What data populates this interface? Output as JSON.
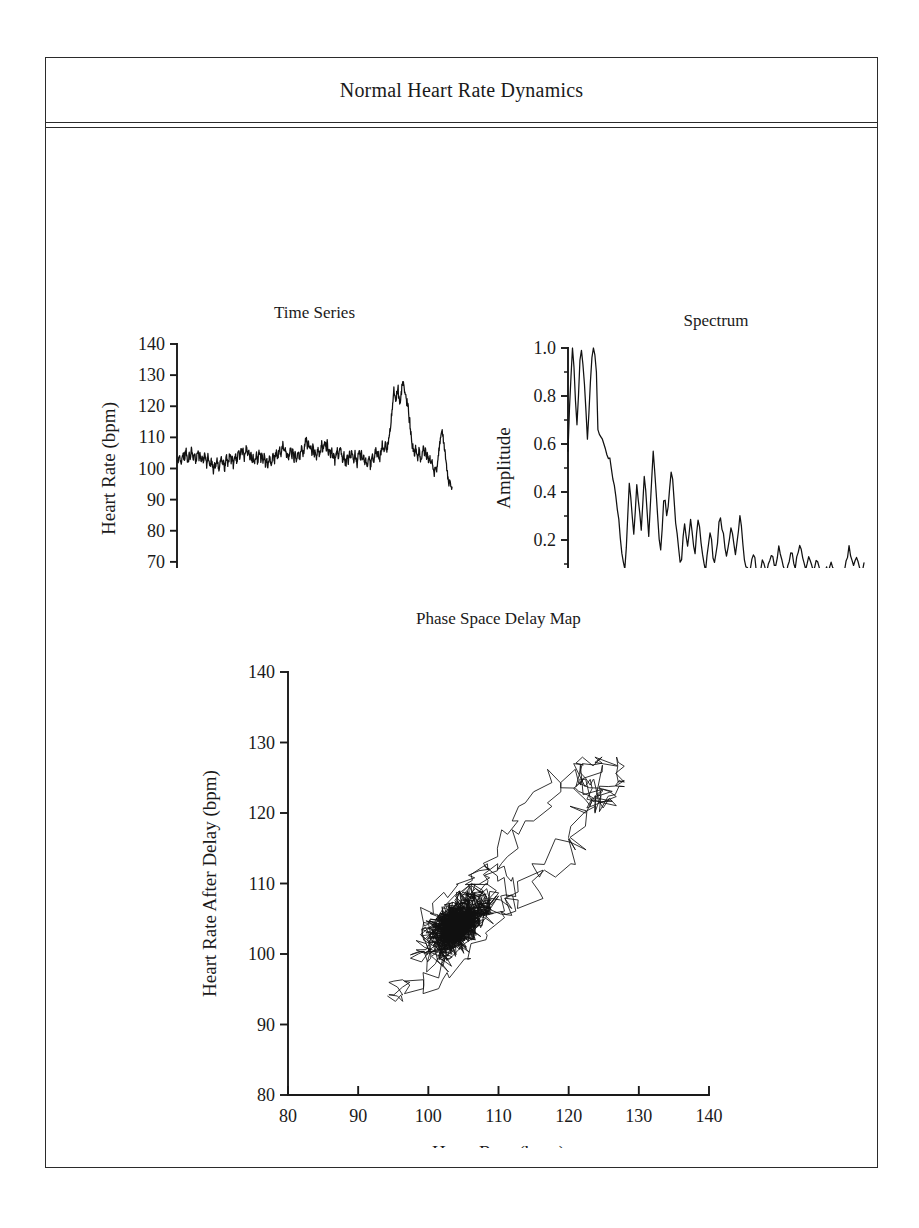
{
  "figure": {
    "title": "Normal Heart Rate Dynamics",
    "background_color": "#ffffff",
    "line_color": "#111111",
    "frame_color": "#2b2b2b"
  },
  "chart_data": [
    {
      "id": "time_series",
      "type": "line",
      "title": "Time Series",
      "xlabel": "Time (sec)",
      "ylabel": "Heart Rate (bpm)",
      "xlim": [
        0,
        900
      ],
      "ylim": [
        60,
        140
      ],
      "xticks": [
        0,
        300,
        600,
        900
      ],
      "xtick_labels": [
        "0",
        "300",
        "600",
        "900"
      ],
      "yticks": [
        60,
        70,
        80,
        90,
        100,
        110,
        120,
        130,
        140
      ],
      "ytick_labels": [
        "60",
        "70",
        "80",
        "90",
        "100",
        "110",
        "120",
        "130",
        "140"
      ],
      "grid": false,
      "legend": null,
      "series": [
        {
          "name": "heart rate",
          "description": "Noisy baseline near 103 bpm for first 700 s, then a large tachycardic burst peaking near 128 bpm around 700-760 s, followed by recovery and a secondary peak near 112 bpm at 880 s, ending near 93 bpm.",
          "x_start": 0,
          "x_end": 900,
          "sample_interval_sec": 1.5,
          "baseline_bpm": 103,
          "noise_amplitude_bpm": 4.5,
          "peak_bpm": 128,
          "min_bpm": 93,
          "events": [
            {
              "t": 710,
              "bpm": 125,
              "label": "burst peak 1"
            },
            {
              "t": 742,
              "bpm": 128,
              "label": "burst peak 2"
            },
            {
              "t": 880,
              "bpm": 112,
              "label": "secondary peak"
            },
            {
              "t": 898,
              "bpm": 93,
              "label": "end dip"
            }
          ],
          "values_bpm": [
            103,
            102,
            104,
            103,
            102,
            105,
            104,
            103,
            106,
            104,
            102,
            105,
            103,
            106,
            104,
            103,
            105,
            102,
            104,
            106,
            103,
            105,
            101,
            104,
            102,
            105,
            103,
            101,
            104,
            102,
            100,
            103,
            101,
            99,
            102,
            100,
            103,
            101,
            99,
            102,
            104,
            101,
            103,
            100,
            102,
            104,
            101,
            103,
            105,
            102,
            104,
            101,
            103,
            105,
            102,
            104,
            106,
            103,
            107,
            104,
            106,
            103,
            105,
            107,
            104,
            106,
            103,
            105,
            102,
            104,
            101,
            103,
            105,
            102,
            104,
            106,
            103,
            105,
            102,
            104,
            101,
            103,
            100,
            102,
            104,
            101,
            103,
            105,
            102,
            104,
            106,
            103,
            105,
            107,
            104,
            106,
            108,
            105,
            107,
            104,
            106,
            103,
            105,
            107,
            104,
            106,
            103,
            105,
            102,
            104,
            106,
            103,
            105,
            107,
            104,
            106,
            108,
            110,
            107,
            109,
            106,
            108,
            105,
            107,
            104,
            106,
            103,
            105,
            107,
            104,
            106,
            108,
            105,
            107,
            109,
            106,
            108,
            105,
            107,
            104,
            106,
            103,
            105,
            102,
            104,
            106,
            103,
            105,
            107,
            104,
            102,
            105,
            103,
            101,
            104,
            102,
            105,
            103,
            106,
            104,
            102,
            105,
            103,
            101,
            104,
            106,
            103,
            105,
            102,
            104,
            101,
            103,
            100,
            102,
            104,
            101,
            103,
            105,
            102,
            104,
            106,
            103,
            105,
            102,
            104,
            106,
            108,
            105,
            107,
            109,
            106,
            108,
            110,
            112,
            115,
            120,
            124,
            125,
            122,
            124,
            126,
            123,
            121,
            124,
            127,
            128,
            126,
            124,
            122,
            120,
            117,
            114,
            111,
            108,
            106,
            104,
            107,
            105,
            103,
            106,
            104,
            102,
            105,
            107,
            104,
            106,
            103,
            105,
            102,
            104,
            101,
            103,
            100,
            98,
            101,
            99,
            102,
            105,
            108,
            111,
            112,
            110,
            107,
            104,
            101,
            98,
            95,
            97,
            94,
            93
          ]
        }
      ]
    },
    {
      "id": "spectrum",
      "type": "line",
      "title": "Spectrum",
      "xlabel": "Frequency (Hz)",
      "ylabel": "Amplitude",
      "xlim": [
        0.0,
        0.1
      ],
      "ylim": [
        0.0,
        1.0
      ],
      "xticks": [
        0.0,
        0.02,
        0.04,
        0.06,
        0.08,
        0.1
      ],
      "xtick_labels": [
        "0.00",
        "0.02",
        "0.04",
        "0.06",
        "0.08",
        "0.10"
      ],
      "xminor_step": 0.01,
      "yticks": [
        0.0,
        0.2,
        0.4,
        0.6,
        0.8,
        1.0
      ],
      "ytick_labels": [
        "0.0",
        "0.2",
        "0.4",
        "0.6",
        "0.8",
        "1.0"
      ],
      "yminor_step": 0.1,
      "grid": false,
      "legend": null,
      "series": [
        {
          "name": "amplitude spectrum",
          "description": "Very low frequency power dominates with amplitude 1.0 near DC, decaying to a broadband 1/f-like tail of roughly 0.05-0.3 above 0.03 Hz.",
          "freq_start": 0.0,
          "freq_end": 0.1,
          "freq_step": 0.000667,
          "peak_amplitude": 1.0,
          "values": [
            0.57,
            0.75,
            0.88,
            1.0,
            0.92,
            0.78,
            0.68,
            0.8,
            0.95,
            0.99,
            0.93,
            0.85,
            0.74,
            0.62,
            0.73,
            0.86,
            0.96,
            1.0,
            0.97,
            0.9,
            0.66,
            0.64,
            0.63,
            0.62,
            0.6,
            0.58,
            0.56,
            0.55,
            0.53,
            0.5,
            0.46,
            0.42,
            0.38,
            0.33,
            0.28,
            0.22,
            0.16,
            0.11,
            0.07,
            0.18,
            0.32,
            0.42,
            0.37,
            0.28,
            0.22,
            0.33,
            0.42,
            0.38,
            0.3,
            0.24,
            0.36,
            0.45,
            0.4,
            0.3,
            0.23,
            0.34,
            0.47,
            0.58,
            0.5,
            0.38,
            0.28,
            0.2,
            0.16,
            0.26,
            0.38,
            0.36,
            0.3,
            0.35,
            0.42,
            0.49,
            0.44,
            0.36,
            0.28,
            0.21,
            0.15,
            0.1,
            0.13,
            0.2,
            0.27,
            0.22,
            0.17,
            0.24,
            0.29,
            0.25,
            0.19,
            0.15,
            0.22,
            0.28,
            0.24,
            0.18,
            0.13,
            0.09,
            0.07,
            0.12,
            0.18,
            0.23,
            0.19,
            0.14,
            0.1,
            0.14,
            0.2,
            0.26,
            0.3,
            0.26,
            0.21,
            0.16,
            0.12,
            0.16,
            0.21,
            0.25,
            0.22,
            0.18,
            0.14,
            0.19,
            0.25,
            0.29,
            0.24,
            0.18,
            0.13,
            0.1,
            0.08,
            0.07,
            0.09,
            0.12,
            0.14,
            0.11,
            0.08,
            0.06,
            0.07,
            0.09,
            0.12,
            0.1,
            0.08,
            0.07,
            0.09,
            0.12,
            0.14,
            0.13,
            0.11,
            0.09,
            0.13,
            0.16,
            0.14,
            0.11,
            0.08,
            0.06,
            0.05,
            0.08,
            0.12,
            0.15,
            0.13,
            0.1,
            0.08,
            0.12,
            0.16,
            0.18,
            0.15,
            0.12,
            0.09,
            0.07,
            0.1,
            0.13,
            0.11,
            0.09,
            0.07,
            0.1,
            0.13,
            0.12,
            0.09,
            0.07,
            0.05,
            0.04,
            0.06,
            0.08,
            0.07,
            0.09,
            0.11,
            0.08,
            0.06,
            0.05,
            0.07,
            0.06,
            0.04,
            0.03,
            0.05,
            0.08,
            0.11,
            0.14,
            0.16,
            0.13,
            0.1,
            0.08,
            0.11,
            0.13,
            0.1,
            0.07,
            0.05,
            0.08,
            0.1
          ]
        }
      ]
    },
    {
      "id": "phase_space_delay_map",
      "type": "scatter",
      "title": "Phase Space Delay Map",
      "xlabel": "Heart Rate (bpm)",
      "ylabel": "Heart Rate After Delay (bpm)",
      "xlim": [
        80,
        140
      ],
      "ylim": [
        80,
        140
      ],
      "xticks": [
        80,
        90,
        100,
        110,
        120,
        130,
        140
      ],
      "xtick_labels": [
        "80",
        "90",
        "100",
        "110",
        "120",
        "130",
        "140"
      ],
      "yticks": [
        80,
        90,
        100,
        110,
        120,
        130,
        140
      ],
      "ytick_labels": [
        "80",
        "90",
        "100",
        "110",
        "120",
        "130",
        "140"
      ],
      "grid": false,
      "legend": null,
      "rendering": "connected trajectory (delay embedding of the time series, lines drawn between consecutive points)",
      "series": [
        {
          "name": "delay trajectory",
          "description": "Dense black cluster centred near (104, 104) bpm spanning roughly 96-112 bpm on both axes, with a large excursion loop extending up and right to about (128, 128) bpm and a sparse tail down to about (95, 94) bpm.",
          "delay_points": "derived from time_series.series.0.values_bpm with a fixed lag",
          "cluster_center": [
            104,
            104
          ],
          "cluster_extent": [
            96,
            112
          ],
          "excursion_max": [
            128,
            128
          ],
          "tail_min": [
            93,
            93
          ]
        }
      ]
    }
  ]
}
